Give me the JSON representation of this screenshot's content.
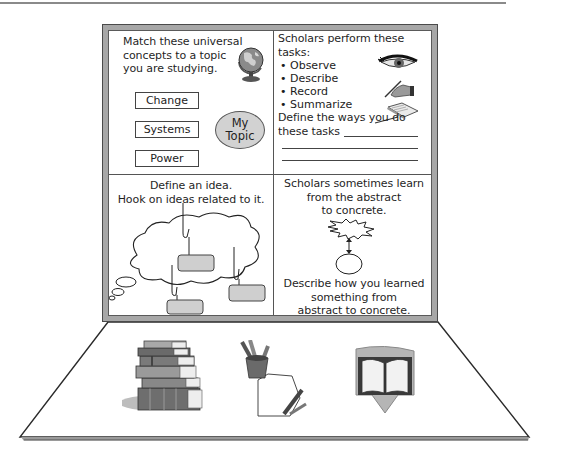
{
  "page": {
    "top_rule": true
  },
  "board": {
    "quadrants": [
      {
        "id": "universal-concepts",
        "prompt_lines": [
          "Match these universal",
          "concepts to a topic",
          "you are studying."
        ],
        "concepts": [
          "Change",
          "Systems",
          "Power"
        ],
        "topic_label_lines": [
          "My",
          "Topic"
        ],
        "icon": "globe-icon"
      },
      {
        "id": "scholar-tasks",
        "prompt_lines": [
          "Scholars perform these",
          "tasks:"
        ],
        "tasks": [
          "Observe",
          "Describe",
          "Record",
          "Summarize"
        ],
        "task_icons": [
          "eye-icon",
          "writing-hand-icon",
          "open-notebook-icon"
        ],
        "define_lines": [
          "Define the ways you do",
          "these tasks"
        ]
      },
      {
        "id": "define-idea",
        "prompt_lines": [
          "Define an idea.",
          "Hook on ideas related to it."
        ],
        "diagram": "thought-cloud-with-hooks",
        "hooked_boxes": 3
      },
      {
        "id": "abstract-to-concrete",
        "prompt_lines": [
          "Scholars sometimes learn",
          "from the abstract",
          "to concrete."
        ],
        "diagram": "starburst-arrow-circle",
        "describe_lines": [
          "Describe how you learned",
          "something from",
          "abstract to concrete."
        ]
      }
    ]
  },
  "desk": {
    "items": [
      "stack-of-books-icon",
      "pencil-cup-and-paper-icon",
      "open-book-shield-icon"
    ]
  },
  "colors": {
    "frame": "#a7a7a7",
    "frame_dark": "#4a4a4a",
    "fill_gray": "#d2d2d2",
    "text": "#1f1f1f",
    "desk_shadow": "#9a9a9a"
  }
}
